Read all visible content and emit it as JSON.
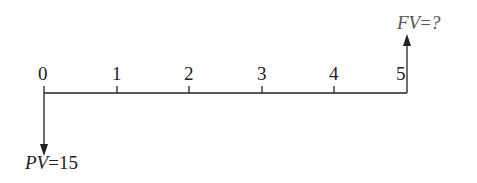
{
  "diagram": {
    "type": "cash-flow timeline",
    "periods": [
      "0",
      "1",
      "2",
      "3",
      "4",
      "5"
    ],
    "present_value": {
      "var": "PV",
      "eq": "=",
      "value": "15"
    },
    "future_value": {
      "var": "FV",
      "eq": "=",
      "value": "?"
    },
    "line_color": "#222222"
  }
}
